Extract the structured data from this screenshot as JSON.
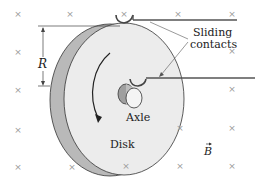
{
  "diagram": {
    "labels": {
      "radius": "R",
      "sliding_contacts_line1": "Sliding",
      "sliding_contacts_line2": "contacts",
      "axle": "Axle",
      "disk": "Disk",
      "field": "B"
    },
    "field_symbol": "×",
    "field_marks": [
      {
        "x": 18,
        "y": 14
      },
      {
        "x": 70,
        "y": 14
      },
      {
        "x": 124,
        "y": 14
      },
      {
        "x": 178,
        "y": 14
      },
      {
        "x": 232,
        "y": 14
      },
      {
        "x": 18,
        "y": 52
      },
      {
        "x": 232,
        "y": 51
      },
      {
        "x": 18,
        "y": 90
      },
      {
        "x": 232,
        "y": 89
      },
      {
        "x": 18,
        "y": 130
      },
      {
        "x": 180,
        "y": 128
      },
      {
        "x": 232,
        "y": 128
      },
      {
        "x": 18,
        "y": 167
      },
      {
        "x": 72,
        "y": 167
      },
      {
        "x": 126,
        "y": 166
      },
      {
        "x": 180,
        "y": 166
      },
      {
        "x": 232,
        "y": 166
      }
    ],
    "colors": {
      "disk_face": "#ececec",
      "disk_rim": "#b8b8b8",
      "outline": "#333333",
      "wire": "#555555",
      "field_mark": "#9a9a9a"
    }
  }
}
